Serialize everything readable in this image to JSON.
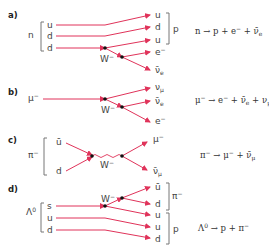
{
  "colors": {
    "line": "#e0335a",
    "vertex": "#111111",
    "bracket": "#777777",
    "text": "#444444"
  },
  "panels": [
    {
      "id": "a",
      "label": "a)",
      "parent": "n",
      "in_quarks": [
        "u",
        "d",
        "d"
      ],
      "boson": "W⁻",
      "out_particles": [
        "u",
        "d",
        "u",
        "e⁻",
        "ν̄e"
      ],
      "product_group": "p",
      "equation": "n → p + e⁻ + ν̄e"
    },
    {
      "id": "b",
      "label": "b)",
      "parent": "μ⁻",
      "boson": "W⁻",
      "out_particles": [
        "νμ",
        "ν̄e",
        "e⁻"
      ],
      "equation": "μ⁻ → e⁻ + ν̄e + νμ"
    },
    {
      "id": "c",
      "label": "c)",
      "parent": "π⁻",
      "in_quarks": [
        "ū",
        "d"
      ],
      "boson": "W⁻",
      "out_particles": [
        "μ⁻",
        "ν̄μ"
      ],
      "equation": "π⁻ → μ⁻ + ν̄μ"
    },
    {
      "id": "d",
      "label": "d)",
      "parent": "Λ⁰",
      "in_quarks": [
        "s",
        "u",
        "d"
      ],
      "boson": "W⁻",
      "out_particles": [
        "ū",
        "d",
        "u",
        "u",
        "d"
      ],
      "product_groups": [
        "π⁻",
        "p"
      ],
      "equation": "Λ⁰ → p + π⁻"
    }
  ]
}
